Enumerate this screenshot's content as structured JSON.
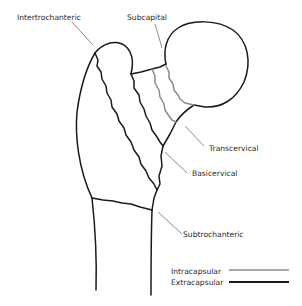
{
  "diagram": {
    "labels": {
      "intertrochanteric": "Intertrochanteric",
      "subcapital": "Subcapital",
      "transcervical": "Transcervical",
      "basicervical": "Basicervical",
      "subtrochanteric": "Subtrochanteric"
    },
    "legend": {
      "intracapsular": "Intracapsular",
      "extracapsular": "Extracapsular"
    },
    "colors": {
      "extracapsular_line": "#1a1a1a",
      "intracapsular_line": "#8a8a8a",
      "leader_line": "#6e6e6e",
      "text": "#2a2a2a",
      "background": "#ffffff"
    }
  }
}
